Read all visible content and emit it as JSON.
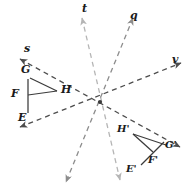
{
  "figure": {
    "background_color": "#ffffff",
    "center_point": {
      "x": 100,
      "y": 102,
      "label": ""
    },
    "colors": {
      "dark_line": "#4d4d4d",
      "light_line": "#b5b5b5",
      "mid_line": "#8c8c8c",
      "figure_stroke": "#3b3b3b",
      "text": "#1a1a1a"
    },
    "lines": [
      {
        "name": "line-s-v",
        "label": "s",
        "label2": "v",
        "color": "#4d4d4d",
        "style": "dashed",
        "arrow_both": true,
        "x1": 18,
        "y1": 58,
        "x2": 182,
        "y2": 66
      },
      {
        "name": "line-v",
        "label": "v",
        "color": "#4d4d4d",
        "style": "dashed",
        "arrow_both": true,
        "x1": 18,
        "y1": 126,
        "x2": 182,
        "y2": 64
      },
      {
        "name": "line-t",
        "label": "t",
        "color": "#b5b5b5",
        "style": "dashed",
        "arrow_both": true,
        "x1": 82,
        "y1": 18,
        "x2": 120,
        "y2": 180
      },
      {
        "name": "line-q",
        "label": "q",
        "color": "#8c8c8c",
        "style": "dashed",
        "arrow_both": true,
        "x1": 133,
        "y1": 18,
        "x2": 66,
        "y2": 182
      }
    ],
    "line_labels": [
      {
        "name": "line-label-s",
        "text": "s",
        "x": 24,
        "y": 44
      },
      {
        "name": "line-label-t",
        "text": "t",
        "x": 82,
        "y": 4
      },
      {
        "name": "line-label-q",
        "text": "q",
        "x": 130,
        "y": 12
      },
      {
        "name": "line-label-v",
        "text": "v",
        "x": 173,
        "y": 55
      }
    ],
    "preimage": {
      "name": "triangle-efgh-preimage",
      "vertices": [
        {
          "name": "vertex-E",
          "label": "E",
          "x": 28,
          "y": 112,
          "label_x": 17,
          "label_y": 110
        },
        {
          "name": "vertex-F",
          "label": "F",
          "x": 28,
          "y": 92,
          "label_x": 12,
          "label_y": 88
        },
        {
          "name": "vertex-G",
          "label": "G",
          "x": 30,
          "y": 78,
          "label_x": 21,
          "label_y": 66
        },
        {
          "name": "vertex-H",
          "label": "H",
          "x": 57,
          "y": 91,
          "label_x": 60,
          "label_y": 85
        }
      ],
      "segments": [
        {
          "from": 0,
          "to": 1
        },
        {
          "from": 1,
          "to": 2
        },
        {
          "from": 2,
          "to": 3
        },
        {
          "from": 3,
          "to": 1
        }
      ]
    },
    "image": {
      "name": "triangle-efgh-image",
      "vertices": [
        {
          "name": "vertex-E-prime",
          "label": "E'",
          "x": 140,
          "y": 166,
          "label_x": 129,
          "label_y": 163
        },
        {
          "name": "vertex-F-prime",
          "label": "F'",
          "x": 152,
          "y": 152,
          "label_x": 151,
          "label_y": 152
        },
        {
          "name": "vertex-G-prime",
          "label": "G'",
          "x": 164,
          "y": 143,
          "label_x": 166,
          "label_y": 140
        },
        {
          "name": "vertex-H-prime",
          "label": "H'",
          "x": 134,
          "y": 132,
          "label_x": 120,
          "label_y": 124
        }
      ],
      "segments": [
        {
          "from": 0,
          "to": 1
        },
        {
          "from": 1,
          "to": 3
        },
        {
          "from": 3,
          "to": 2
        },
        {
          "from": 2,
          "to": 1
        }
      ]
    }
  }
}
